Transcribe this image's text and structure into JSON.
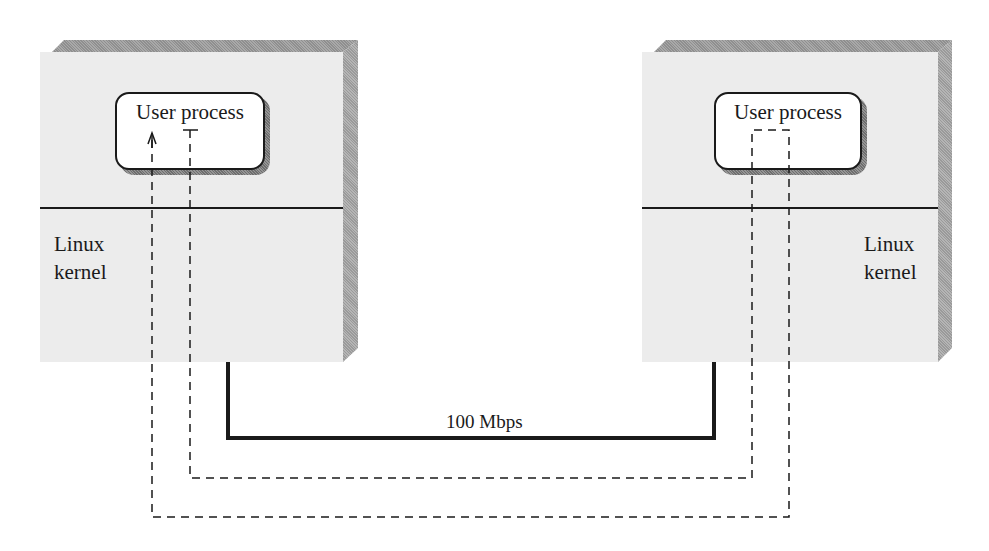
{
  "hosts": [
    {
      "user_process_label": "User process",
      "kernel_label_line1": "Linux",
      "kernel_label_line2": "kernel"
    },
    {
      "user_process_label": "User process",
      "kernel_label_line1": "Linux",
      "kernel_label_line2": "kernel"
    }
  ],
  "link": {
    "label": "100 Mbps"
  },
  "colors": {
    "face": "#ececec",
    "line": "#1a1a1a"
  }
}
